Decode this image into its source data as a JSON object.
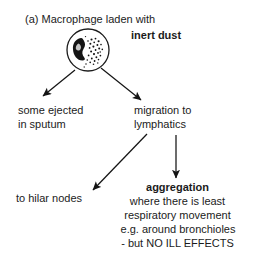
{
  "figure": {
    "label": "(a)",
    "title_line": "(a) Macrophage laden with",
    "title_emphasis": "inert dust",
    "diagram_type": "flow-diagram",
    "illustration": {
      "name": "macrophage-cell",
      "description": "macrophage cell containing nucleus and inert dust particles"
    },
    "branches": {
      "left": {
        "line1": "some ejected",
        "line2": "in sputum"
      },
      "right": {
        "line1": "migration to",
        "line2": "lymphatics"
      }
    },
    "outcomes": {
      "hilar": "to hilar nodes",
      "aggregation_heading": "aggregation",
      "aggregation_line1": "where there is least",
      "aggregation_line2": "respiratory movement",
      "aggregation_line3": "e.g. around bronchioles",
      "aggregation_line4": "- but NO ILL EFFECTS"
    },
    "colors": {
      "ink": "#1b1b1b",
      "background": "#ffffff"
    }
  }
}
